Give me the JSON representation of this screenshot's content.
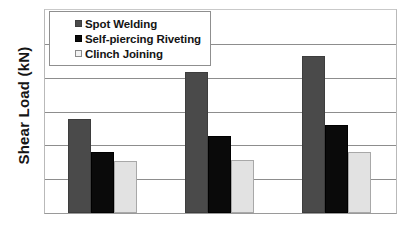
{
  "chart_data": {
    "type": "bar",
    "title": "",
    "xlabel": "",
    "ylabel": "Shear Load (kN)",
    "categories": [
      "Group 1",
      "Group 2",
      "Group 3"
    ],
    "series": [
      {
        "name": "Spot Welding",
        "color": "#4a4a4a",
        "values": [
          2.78,
          4.16,
          4.65
        ]
      },
      {
        "name": "Self-piercing Riveting",
        "color": "#0a0a0a",
        "values": [
          1.81,
          2.28,
          2.6
        ]
      },
      {
        "name": "Clinch Joining",
        "color": "#e2e2e2",
        "values": [
          1.55,
          1.58,
          1.79
        ]
      }
    ],
    "ylim": [
      0,
      6
    ],
    "ytick_count": 6,
    "ytick_labels": [],
    "xtick_labels": [],
    "grid": true,
    "grid_axis": "y",
    "legend_position": "top-left"
  },
  "legend": {
    "items": [
      {
        "label": "Spot Welding",
        "swatch": "legend-swatch-spot-welding"
      },
      {
        "label": "Self-piercing Riveting",
        "swatch": "legend-swatch-self-piercing-riveting"
      },
      {
        "label": "Clinch Joining",
        "swatch": "legend-swatch-clinch-joining"
      }
    ]
  },
  "axes": {
    "y_title": "Shear Load (kN)"
  },
  "colors": {
    "spot_welding": "#4a4a4a",
    "self_piercing_riveting": "#0a0a0a",
    "clinch_joining": "#e2e2e2",
    "gridline": "#8d8d8d",
    "plot_border": "#b9b9b9",
    "background": "#ffffff",
    "text": "#141414"
  }
}
